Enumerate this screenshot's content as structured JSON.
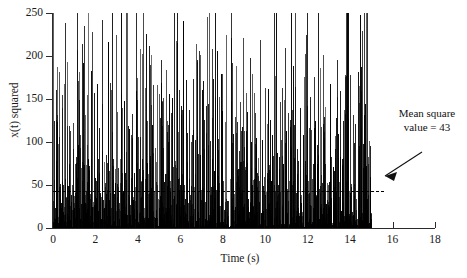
{
  "chart_data": {
    "type": "line",
    "style": "impulse/spike plot of squared random signal",
    "title": "",
    "xlabel": "Time (s)",
    "ylabel": "x(t) squared",
    "xlim": [
      0,
      18
    ],
    "ylim": [
      0,
      250
    ],
    "grid": false,
    "legend": null,
    "x_ticks": [
      0,
      2,
      4,
      6,
      8,
      10,
      12,
      14,
      16,
      18
    ],
    "y_ticks": [
      0,
      50,
      100,
      150,
      200,
      250
    ],
    "data_extent_x": [
      0,
      15
    ],
    "annotations": [
      {
        "name": "mean-square-annotation",
        "line1": "Mean square",
        "line2": "value = 43",
        "value": 43,
        "points_to": "mean-square-line"
      }
    ],
    "reference_lines": [
      {
        "name": "mean-square-line",
        "orientation": "horizontal",
        "y": 43,
        "x_from": 0,
        "x_to": 15.6,
        "style": "dashed",
        "color": "#000000"
      }
    ],
    "series": [
      {
        "name": "x(t) squared",
        "color": "#000000",
        "note": "dense impulse train, ~1500 samples from t=0 to t=15 s, peaks up to ~245",
        "peaks": [
          {
            "t": 0.18,
            "v": 131
          },
          {
            "t": 0.42,
            "v": 155
          },
          {
            "t": 0.56,
            "v": 238
          },
          {
            "t": 0.93,
            "v": 122
          },
          {
            "t": 1.22,
            "v": 181
          },
          {
            "t": 1.36,
            "v": 214
          },
          {
            "t": 1.58,
            "v": 97
          },
          {
            "t": 1.84,
            "v": 228
          },
          {
            "t": 2.05,
            "v": 168
          },
          {
            "t": 2.31,
            "v": 144
          },
          {
            "t": 2.58,
            "v": 196
          },
          {
            "t": 2.77,
            "v": 112
          },
          {
            "t": 2.96,
            "v": 224
          },
          {
            "t": 3.22,
            "v": 156
          },
          {
            "t": 3.44,
            "v": 88
          },
          {
            "t": 3.71,
            "v": 133
          },
          {
            "t": 3.95,
            "v": 175
          },
          {
            "t": 4.18,
            "v": 202
          },
          {
            "t": 4.36,
            "v": 226
          },
          {
            "t": 4.62,
            "v": 143
          },
          {
            "t": 4.88,
            "v": 166
          },
          {
            "t": 5.12,
            "v": 119
          },
          {
            "t": 5.34,
            "v": 184
          },
          {
            "t": 5.59,
            "v": 151
          },
          {
            "t": 5.83,
            "v": 215
          },
          {
            "t": 6.07,
            "v": 137
          },
          {
            "t": 6.28,
            "v": 172
          },
          {
            "t": 6.55,
            "v": 108
          },
          {
            "t": 6.79,
            "v": 193
          },
          {
            "t": 7.02,
            "v": 161
          },
          {
            "t": 7.25,
            "v": 245
          },
          {
            "t": 7.48,
            "v": 128
          },
          {
            "t": 7.71,
            "v": 206
          },
          {
            "t": 7.94,
            "v": 179
          },
          {
            "t": 8.16,
            "v": 225
          },
          {
            "t": 8.38,
            "v": 148
          },
          {
            "t": 8.62,
            "v": 188
          },
          {
            "t": 8.85,
            "v": 113
          },
          {
            "t": 9.08,
            "v": 157
          },
          {
            "t": 9.31,
            "v": 198
          },
          {
            "t": 9.54,
            "v": 134
          },
          {
            "t": 9.77,
            "v": 219
          },
          {
            "t": 10.01,
            "v": 163
          },
          {
            "t": 10.24,
            "v": 126
          },
          {
            "t": 10.47,
            "v": 177
          },
          {
            "t": 10.71,
            "v": 146
          },
          {
            "t": 10.94,
            "v": 209
          },
          {
            "t": 11.18,
            "v": 118
          },
          {
            "t": 11.41,
            "v": 164
          },
          {
            "t": 11.64,
            "v": 139
          },
          {
            "t": 11.88,
            "v": 202
          },
          {
            "t": 12.11,
            "v": 152
          },
          {
            "t": 12.34,
            "v": 124
          },
          {
            "t": 12.58,
            "v": 186
          },
          {
            "t": 12.81,
            "v": 141
          },
          {
            "t": 13.04,
            "v": 168
          },
          {
            "t": 13.28,
            "v": 107
          },
          {
            "t": 13.51,
            "v": 159
          },
          {
            "t": 13.74,
            "v": 132
          },
          {
            "t": 13.98,
            "v": 178
          },
          {
            "t": 14.21,
            "v": 121
          },
          {
            "t": 14.44,
            "v": 165
          },
          {
            "t": 14.68,
            "v": 144
          },
          {
            "t": 14.91,
            "v": 101
          }
        ]
      }
    ]
  }
}
